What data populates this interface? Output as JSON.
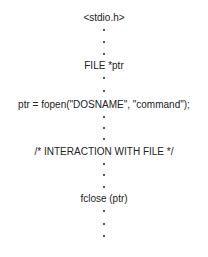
{
  "diagram": {
    "type": "c-file-io-flow",
    "steps": [
      {
        "id": "include",
        "label": "<stdio.h>",
        "y": 18
      },
      {
        "id": "declare",
        "label": "FILE *ptr",
        "y": 66
      },
      {
        "id": "open",
        "label": "ptr = fopen(\"DOSNAME\", \"command\");",
        "y": 105
      },
      {
        "id": "interact",
        "label": "/* INTERACTION WITH FILE */",
        "y": 152
      },
      {
        "id": "close",
        "label": "fclose (ptr)",
        "y": 199
      }
    ],
    "ellipsis_dots_y": [
      30,
      42,
      54,
      78,
      91,
      117,
      128,
      139,
      164,
      175,
      187,
      211,
      224,
      236
    ],
    "colors": {
      "text": "#222222",
      "background": "#ffffff"
    }
  }
}
